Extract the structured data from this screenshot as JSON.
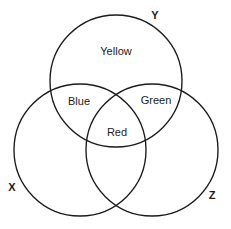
{
  "figure": {
    "width": 231,
    "height": 229,
    "background_color": "#ffffff",
    "stroke_color": "#1b1b1b",
    "text_color": "#1b1b1b"
  },
  "sets": [
    {
      "id": "set-y",
      "label": "Y",
      "label_x": 155,
      "label_y": 16,
      "center_x": 116,
      "center_y": 81,
      "radius": 66
    },
    {
      "id": "set-x",
      "label": "X",
      "label_x": 12,
      "label_y": 188,
      "center_x": 80,
      "center_y": 150,
      "radius": 66
    },
    {
      "id": "set-z",
      "label": "Z",
      "label_x": 212,
      "label_y": 196,
      "center_x": 152,
      "center_y": 150,
      "radius": 66
    }
  ],
  "regions": [
    {
      "id": "region-yellow",
      "label": "Yellow",
      "label_x": 116,
      "label_y": 52,
      "belongs_to": "Y only"
    },
    {
      "id": "region-blue",
      "label": "Blue",
      "label_x": 79,
      "label_y": 102,
      "belongs_to": "X and Y"
    },
    {
      "id": "region-green",
      "label": "Green",
      "label_x": 156,
      "label_y": 101,
      "belongs_to": "Y and Z"
    },
    {
      "id": "region-red",
      "label": "Red",
      "label_x": 117,
      "label_y": 133,
      "belongs_to": "X and Y and Z"
    }
  ]
}
